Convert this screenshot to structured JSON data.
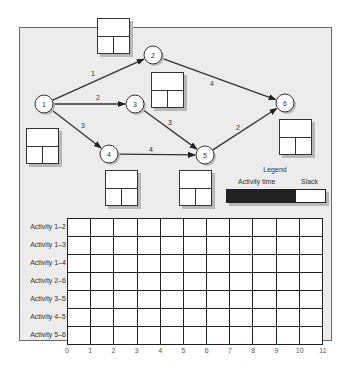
{
  "network": {
    "nodes": [
      {
        "id": "1",
        "label": "1",
        "x": 44,
        "y": 104
      },
      {
        "id": "2",
        "label": "2",
        "x": 153,
        "y": 55
      },
      {
        "id": "3",
        "label": "3",
        "x": 135,
        "y": 104
      },
      {
        "id": "4",
        "label": "4",
        "x": 109,
        "y": 154
      },
      {
        "id": "5",
        "label": "5",
        "x": 205,
        "y": 155
      },
      {
        "id": "6",
        "label": "6",
        "x": 285,
        "y": 103
      }
    ],
    "edges": [
      {
        "from": "1",
        "to": "2",
        "label": "1",
        "lx": 93,
        "ly": 76
      },
      {
        "from": "1",
        "to": "3",
        "label": "2",
        "lx": 98,
        "ly": 100
      },
      {
        "from": "1",
        "to": "4",
        "label": "3",
        "lx": 83,
        "ly": 128
      },
      {
        "from": "2",
        "to": "6",
        "label": "4",
        "lx": 212,
        "ly": 86
      },
      {
        "from": "3",
        "to": "5",
        "label": "3",
        "lx": 170,
        "ly": 125
      },
      {
        "from": "4",
        "to": "5",
        "label": "4",
        "lx": 151,
        "ly": 152
      },
      {
        "from": "5",
        "to": "6",
        "label": "2",
        "lx": 238,
        "ly": 130
      }
    ],
    "event_boxes": [
      {
        "node": "1",
        "x": 26,
        "y": 128
      },
      {
        "node": "2",
        "x": 97,
        "y": 18
      },
      {
        "node": "3",
        "x": 151,
        "y": 72
      },
      {
        "node": "4",
        "x": 105,
        "y": 170
      },
      {
        "node": "5",
        "x": 179,
        "y": 170
      },
      {
        "node": "6",
        "x": 279,
        "y": 119
      }
    ]
  },
  "legend": {
    "title": "Legend",
    "activity_time_label": "Activity time",
    "slack_label": "Slack",
    "activity_color": "#222222",
    "slack_color": "#ffffff"
  },
  "gantt": {
    "rows": [
      "Activity 1–2",
      "Activity 1–3",
      "Activity 1–4",
      "Activity 2–6",
      "Activity 3–5",
      "Activity 4–5",
      "Activity 5–6"
    ],
    "x_ticks": [
      "0",
      "1",
      "2",
      "3",
      "4",
      "5",
      "6",
      "7",
      "8",
      "9",
      "10",
      "11"
    ]
  }
}
